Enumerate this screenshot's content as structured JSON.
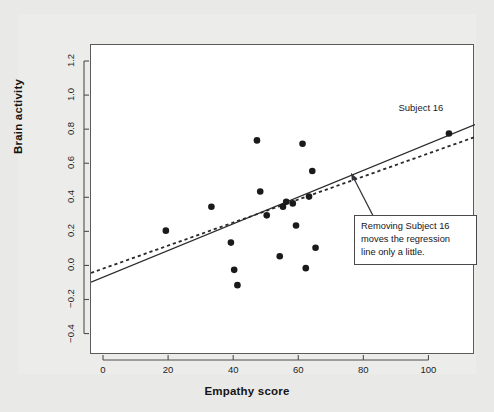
{
  "figure": {
    "background_color": "#e9e9e7",
    "panel_color": "#ffffff",
    "frame_color": "#5b5b5b"
  },
  "annotation": {
    "callout_text": "Removing Subject 16\nmoves the regression\nline only a little.",
    "point_label": "Subject 16"
  },
  "chart_data": {
    "type": "scatter",
    "title": "",
    "xlabel": "Empathy score",
    "ylabel": "Brain activity",
    "xlim": [
      -4,
      114
    ],
    "ylim": [
      -0.52,
      1.3
    ],
    "xticks": [
      0,
      20,
      40,
      60,
      80,
      100
    ],
    "xtick_labels": [
      "0",
      "20",
      "40",
      "60",
      "80",
      "100"
    ],
    "yticks": [
      -0.4,
      -0.2,
      0.0,
      0.2,
      0.4,
      0.6,
      0.8,
      1.0,
      1.2
    ],
    "ytick_labels": [
      "-0.4",
      "-0.2",
      "0.0",
      "0.2",
      "0.4",
      "0.6",
      "0.8",
      "1.0",
      "1.2"
    ],
    "grid": false,
    "legend": null,
    "point_color": "#1a1a1a",
    "point_size": 3.3,
    "points": [
      {
        "x": 19,
        "y": 0.21
      },
      {
        "x": 33,
        "y": 0.35
      },
      {
        "x": 39,
        "y": 0.14
      },
      {
        "x": 40,
        "y": -0.02
      },
      {
        "x": 41,
        "y": -0.11
      },
      {
        "x": 47,
        "y": 0.74
      },
      {
        "x": 48,
        "y": 0.44
      },
      {
        "x": 50,
        "y": 0.3
      },
      {
        "x": 54,
        "y": 0.06
      },
      {
        "x": 55,
        "y": 0.35
      },
      {
        "x": 56,
        "y": 0.38
      },
      {
        "x": 58,
        "y": 0.37
      },
      {
        "x": 59,
        "y": 0.24
      },
      {
        "x": 61,
        "y": 0.72
      },
      {
        "x": 62,
        "y": -0.01
      },
      {
        "x": 63,
        "y": 0.41
      },
      {
        "x": 64,
        "y": 0.56
      },
      {
        "x": 65,
        "y": 0.11
      },
      {
        "x": 106,
        "y": 0.78
      }
    ],
    "lines": [
      {
        "name": "regression-all-subjects",
        "style": "solid",
        "color": "#2a2a2a",
        "x": [
          -4,
          114
        ],
        "y": [
          -0.093,
          0.833
        ]
      },
      {
        "name": "regression-without-subject-16",
        "style": "dashed",
        "color": "#2a2a2a",
        "x": [
          -4,
          114
        ],
        "y": [
          -0.038,
          0.76
        ]
      }
    ],
    "annotations": [
      {
        "name": "subject-16-label",
        "text": "Subject 16",
        "x": 100,
        "y": 0.92
      },
      {
        "name": "regression-callout",
        "text": "Removing Subject 16\nmoves the regression\nline only a little.",
        "arrow_from_x": 83,
        "arrow_from_y": 0.285,
        "arrow_to_x": 76,
        "arrow_to_y": 0.545
      }
    ]
  }
}
